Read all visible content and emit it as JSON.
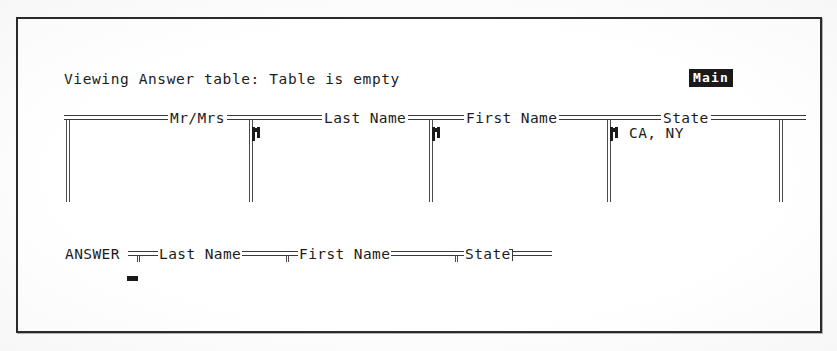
{
  "window": {
    "frame_style": "single-line-box"
  },
  "status": {
    "message": "Viewing Answer table: Table is empty"
  },
  "mode_badge": {
    "label": "Main",
    "inverse_video": true,
    "bg_color": "#1a1a1a",
    "fg_color": "#ffffff"
  },
  "table_view": {
    "name": "Answer",
    "empty": true,
    "columns": [
      {
        "header": "Mr/Mrs",
        "value": "",
        "marker": false
      },
      {
        "header": "Last Name",
        "value": "",
        "marker": true
      },
      {
        "header": "First Name",
        "value": "",
        "marker": true
      },
      {
        "header": "State",
        "value": "CA, NY",
        "marker": true
      }
    ]
  },
  "query_line": {
    "table_label": "ANSWER",
    "fields": [
      {
        "label": "Last Name"
      },
      {
        "label": "First Name"
      },
      {
        "label": "State"
      }
    ]
  },
  "cursor": {
    "visible": true,
    "shape": "underscore-block"
  },
  "colors": {
    "ink": "#1c1c1c",
    "rule": "#3a3a3a",
    "paper": "#ffffff",
    "frame": "#2b2b2b"
  }
}
